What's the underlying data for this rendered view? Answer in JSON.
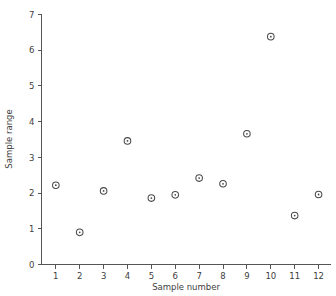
{
  "chart_data": {
    "type": "scatter",
    "title": "",
    "xlabel": "Sample number",
    "ylabel": "Sample range",
    "x": [
      1,
      2,
      3,
      4,
      5,
      6,
      7,
      8,
      9,
      10,
      11,
      12
    ],
    "values": [
      2.22,
      0.9,
      2.06,
      3.46,
      1.86,
      1.95,
      2.42,
      2.26,
      3.66,
      6.38,
      1.37,
      1.96
    ],
    "xlim": [
      0.4,
      12.5
    ],
    "ylim": [
      0,
      7
    ],
    "xticks": [
      "1",
      "2",
      "3",
      "4",
      "5",
      "6",
      "7",
      "8",
      "9",
      "10",
      "11",
      "12"
    ],
    "yticks": [
      "0",
      "1",
      "2",
      "3",
      "4",
      "5",
      "6",
      "7"
    ],
    "grid": false,
    "legend": null,
    "marker": "circle-with-dot",
    "marker_color": "#4a4a4a"
  },
  "axes": {
    "x_title": "Sample number",
    "y_title": "Sample range"
  }
}
